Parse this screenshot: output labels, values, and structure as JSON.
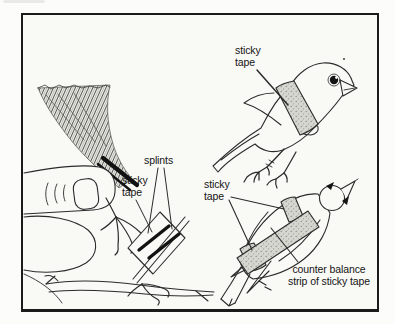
{
  "figure": {
    "panels": {
      "leg_splint": {
        "labels": {
          "splints": "splints",
          "sticky_tape": "sticky\ntape"
        }
      },
      "bird_side": {
        "labels": {
          "sticky_tape": "sticky\ntape"
        }
      },
      "bird_dorsal": {
        "labels": {
          "sticky_tape": "sticky\ntape",
          "counter_balance": "counter balance\nstrip of sticky tape"
        }
      }
    }
  },
  "colors": {
    "ink": "#2b2b2b",
    "frame_border": "#1b1b1b",
    "tape_fill": "#d7d7d1",
    "tape_speckle": "#8d8d85",
    "page_background": "#fcfcfa",
    "panel_background": "#f9f9f6"
  }
}
